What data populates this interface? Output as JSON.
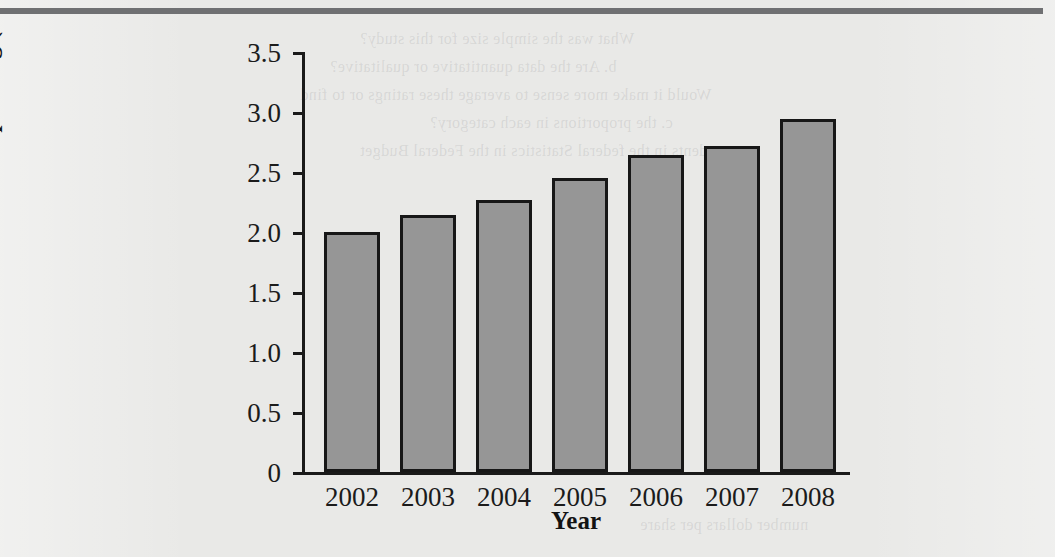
{
  "page": {
    "top_rule_color": "#6f7072",
    "background_color": "#e9e9e7",
    "ghost_text": [
      "What was the simple size for this study?",
      "b. Are the data quantitative or qualitative?",
      "Would it make more sense to average these ratings or to find",
      "c. the proportions in each category?",
      "respondents in the federal Statistics in the Federal Budget",
      "number dollars per share"
    ]
  },
  "chart_data": {
    "type": "bar",
    "title": "",
    "xlabel": "Year",
    "ylabel": "Federal Spending ($ trillions)",
    "categories": [
      "2002",
      "2003",
      "2004",
      "2005",
      "2006",
      "2007",
      "2008"
    ],
    "values": [
      2.0,
      2.14,
      2.27,
      2.45,
      2.64,
      2.72,
      2.94
    ],
    "ylim": [
      0,
      3.5
    ],
    "ytick_labels": [
      "0",
      "0.5",
      "1.0",
      "1.5",
      "2.0",
      "2.5",
      "3.0",
      "3.5"
    ],
    "ytick_values": [
      0,
      0.5,
      1.0,
      1.5,
      2.0,
      2.5,
      3.0,
      3.5
    ],
    "grid": false,
    "legend": null,
    "bar_fill_color": "#969696",
    "bar_edge_color": "#171717",
    "axis_color": "#1a1a1a"
  }
}
